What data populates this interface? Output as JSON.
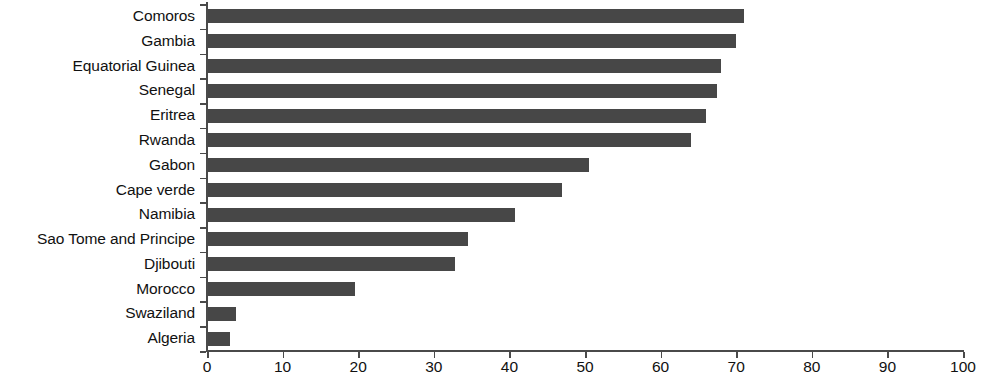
{
  "chart_data": {
    "type": "bar",
    "orientation": "horizontal",
    "title": "",
    "subtitle": "",
    "xlabel": "",
    "ylabel": "",
    "xlim": [
      0,
      100
    ],
    "xticks": [
      0,
      10,
      20,
      30,
      40,
      50,
      60,
      70,
      80,
      90,
      100
    ],
    "xtick_labels": [
      "0",
      "10",
      "20",
      "30",
      "40",
      "50",
      "60",
      "70",
      "80",
      "90",
      "100"
    ],
    "grid": false,
    "legend": null,
    "bar_color": "#474747",
    "axis_color": "#4a4a4a",
    "categories": [
      "Comoros",
      "Gambia",
      "Equatorial Guinea",
      "Senegal",
      "Eritrea",
      "Rwanda",
      "Gabon",
      "Cape verde",
      "Namibia",
      "Sao Tome and Principe",
      "Djibouti",
      "Morocco",
      "Swaziland",
      "Algeria"
    ],
    "values": [
      71,
      70,
      68,
      67.5,
      66,
      64,
      50.5,
      47,
      40.7,
      34.5,
      32.8,
      19.6,
      3.8,
      3
    ],
    "series": [
      {
        "name": "value",
        "values": [
          71,
          70,
          68,
          67.5,
          66,
          64,
          50.5,
          47,
          40.7,
          34.5,
          32.8,
          19.6,
          3.8,
          3
        ]
      }
    ]
  }
}
